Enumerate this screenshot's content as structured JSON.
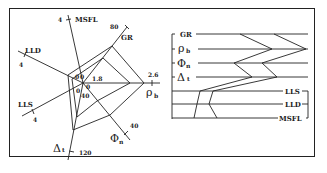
{
  "radar": {
    "axes": [
      {
        "name": "MSFL",
        "min": "0",
        "max": "4"
      },
      {
        "name": "GR",
        "min": "0",
        "max": "80"
      },
      {
        "name": "ρb",
        "min": "1.8",
        "max": "2.6"
      },
      {
        "name": "Φn",
        "min": "40",
        "max": "40"
      },
      {
        "name": "Δt",
        "min": "40",
        "max": "120"
      },
      {
        "name": "LLS",
        "min": "0",
        "max": "4"
      },
      {
        "name": "LLD",
        "min": "0",
        "max": "4"
      }
    ],
    "labels": {
      "msfl": "MSFL",
      "msfl_max": "4",
      "gr": "GR",
      "gr_max": "80",
      "rho": "ρ",
      "rho_sub": "b",
      "rho_max": "2.6",
      "rho_min": "1.8",
      "phi": "Φ",
      "phi_sub": "n",
      "phi_max": "40",
      "dt": "Δ",
      "dt_sub": "t",
      "dt_max": "120",
      "dt_min": "40",
      "lls": "LLS",
      "lls_max": "4",
      "lld": "LLD",
      "lld_max": "4",
      "zero_a": "0",
      "zero_b": "0",
      "zero_c": "0",
      "zero_d": "0"
    }
  },
  "log_panel": {
    "curves": [
      {
        "name": "GR",
        "rho": "ρ",
        "sub": ""
      },
      {
        "name": "ρ",
        "sub": "b"
      },
      {
        "name": "Φ",
        "sub": "n"
      },
      {
        "name": "Δ",
        "sub": "t"
      },
      {
        "name": "LLS",
        "sub": ""
      },
      {
        "name": "LLD",
        "sub": ""
      },
      {
        "name": "MSFL",
        "sub": ""
      }
    ],
    "labels": {
      "gr": "GR",
      "rho": "ρ",
      "rho_sub": "b",
      "phi": "Φ",
      "phi_sub": "n",
      "dt": "Δ",
      "dt_sub": "t",
      "lls": "LLS",
      "lld": "LLD",
      "msfl": "MSFL"
    }
  }
}
